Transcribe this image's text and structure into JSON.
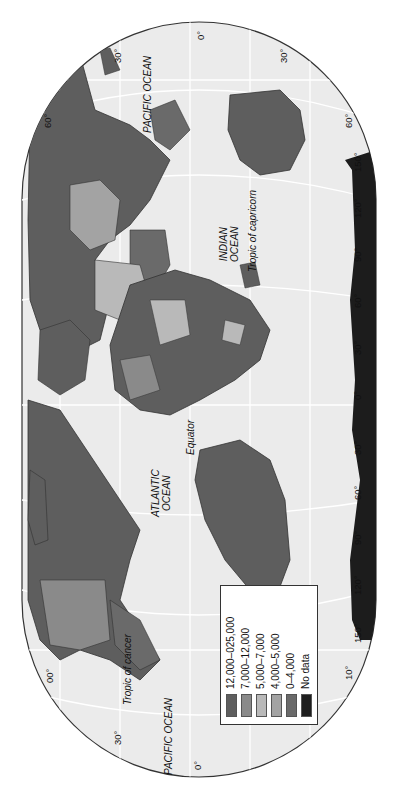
{
  "map": {
    "type": "choropleth world map (rotated 90°, north to the left)",
    "colors": {
      "ocean": "#ebebeb",
      "outline": "#333333",
      "graticule": "#ffffff",
      "antarctica": "#1c1c1c"
    },
    "oceans": {
      "pacific_top": "PACIFIC OCEAN",
      "pacific_bottom": "PACIFIC OCEAN",
      "atlantic_line1": "ATLANTIC",
      "atlantic_line2": "OCEAN",
      "indian_line1": "INDIAN",
      "indian_line2": "OCEAN"
    },
    "lines": {
      "equator": "Equator",
      "tropic_capricorn": "Tropic of capricorn",
      "tropic_cancer": "Tropic of cancer"
    },
    "latitude_ticks_left": [
      "30°",
      "0°",
      "30°",
      "60°"
    ],
    "latitude_ticks_right": [
      "0°",
      "30°",
      "60°"
    ],
    "top_ticks": [
      "30°",
      "0°",
      "30°"
    ],
    "north_ticks": [
      "60°",
      "00°"
    ],
    "bottom_ticks": [
      "30°",
      "0°"
    ],
    "longitude_ticks": [
      "150°",
      "120°",
      "90°",
      "60°",
      "30°",
      "0°",
      "30°",
      "60°",
      "90°",
      "120°",
      "150°",
      "10°"
    ]
  },
  "legend": {
    "items": [
      {
        "label": "12,000–025,000",
        "color": "#5e5e5e"
      },
      {
        "label": "7,000–12,000",
        "color": "#8a8a8a"
      },
      {
        "label": "5,000–7,000",
        "color": "#b9b9b9"
      },
      {
        "label": "4,000–5,000",
        "color": "#a3a3a3"
      },
      {
        "label": "0–4,000",
        "color": "#6a6a6a"
      },
      {
        "label": "No data",
        "color": "#1e1e1e"
      }
    ]
  }
}
